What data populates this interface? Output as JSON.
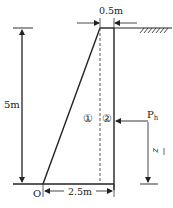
{
  "diagram": {
    "type": "retaining-wall-cross-section",
    "labels": {
      "height": "5m",
      "top_width": "0.5m",
      "base_width": "2.5m",
      "origin": "O",
      "region_1": "①",
      "region_2": "②",
      "force": "P",
      "force_sub": "h",
      "lever_arm": "z"
    },
    "colors": {
      "line": "#222222",
      "dim": "#333333",
      "dashed": "#555555",
      "background": "#ffffff"
    }
  }
}
